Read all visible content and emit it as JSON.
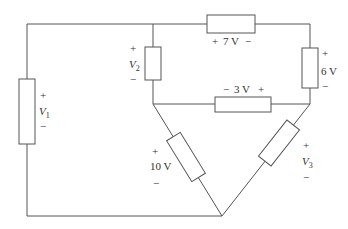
{
  "diagram": {
    "type": "circuit",
    "colors": {
      "wire": "#555555",
      "text": "#333333",
      "background": "#ffffff"
    },
    "elements": [
      {
        "id": "V1",
        "label_main": "V",
        "label_sub": "1",
        "plus": "+",
        "minus": "−",
        "orientation": "vertical",
        "position": "left branch"
      },
      {
        "id": "V2",
        "label_main": "V",
        "label_sub": "2",
        "plus": "+",
        "minus": "−",
        "orientation": "vertical",
        "position": "inner top-left branch"
      },
      {
        "id": "R7",
        "label": "7 V",
        "plus": "+",
        "minus": "−",
        "orientation": "horizontal",
        "position": "top wire"
      },
      {
        "id": "R6",
        "label": "6 V",
        "plus": "+",
        "minus": "−",
        "orientation": "vertical",
        "position": "right branch"
      },
      {
        "id": "R3",
        "label": "3 V",
        "plus": "+",
        "minus": "−",
        "orientation": "horizontal",
        "position": "middle wire"
      },
      {
        "id": "R10",
        "label": "10 V",
        "plus": "+",
        "minus": "−",
        "orientation": "diagonal",
        "position": "lower-left diagonal"
      },
      {
        "id": "V3",
        "label_main": "V",
        "label_sub": "3",
        "plus": "+",
        "minus": "−",
        "orientation": "diagonal",
        "position": "lower-right diagonal"
      }
    ],
    "labels": {
      "top": "+  7 V  −",
      "middle": "−  3 V  +",
      "right": "6 V",
      "left_diag": "10 V"
    }
  }
}
